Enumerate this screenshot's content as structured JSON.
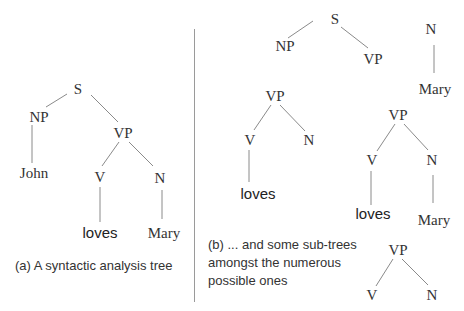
{
  "figure": {
    "panel_a": {
      "caption": "(a) A syntactic analysis tree",
      "tree": {
        "root": "S",
        "np": "NP",
        "vp": "VP",
        "john": "John",
        "v": "V",
        "n": "N",
        "loves": "loves",
        "mary": "Mary"
      }
    },
    "panel_b": {
      "caption_lines": [
        "(b) ... and some sub-trees",
        "amongst the numerous",
        "possible ones"
      ],
      "subtrees": [
        {
          "root": "S",
          "left": "NP",
          "right": "VP"
        },
        {
          "root": "N",
          "child": "Mary"
        },
        {
          "root": "VP",
          "left": "V",
          "right": "N",
          "left_child": "loves"
        },
        {
          "root": "VP",
          "left": "V",
          "right": "N",
          "left_child": "loves",
          "right_child": "Mary"
        },
        {
          "root": "VP",
          "left": "V",
          "right": "N"
        }
      ]
    },
    "colors": {
      "edge": "#8a8a8a",
      "text": "#333333",
      "divider": "#9a9a9a",
      "background": "#ffffff"
    }
  }
}
